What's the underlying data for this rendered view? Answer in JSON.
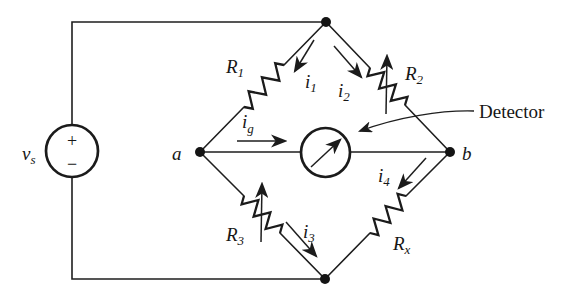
{
  "diagram": {
    "colors": {
      "line": "#1b1b1b",
      "background": "#ffffff"
    },
    "source": {
      "label": "v",
      "sub": "s",
      "plus": "+",
      "minus": "−"
    },
    "nodes": {
      "a": "a",
      "b": "b"
    },
    "resistors": {
      "r1": {
        "label": "R",
        "sub": "1",
        "variable": false
      },
      "r2": {
        "label": "R",
        "sub": "2",
        "variable": true
      },
      "r3": {
        "label": "R",
        "sub": "3",
        "variable": true
      },
      "rx": {
        "label": "R",
        "sub": "x",
        "variable": false
      }
    },
    "currents": {
      "i1": {
        "label": "i",
        "sub": "1"
      },
      "i2": {
        "label": "i",
        "sub": "2"
      },
      "i3": {
        "label": "i",
        "sub": "3"
      },
      "i4": {
        "label": "i",
        "sub": "4"
      },
      "ig": {
        "label": "i",
        "sub": "g"
      }
    },
    "detector_label": "Detector"
  }
}
